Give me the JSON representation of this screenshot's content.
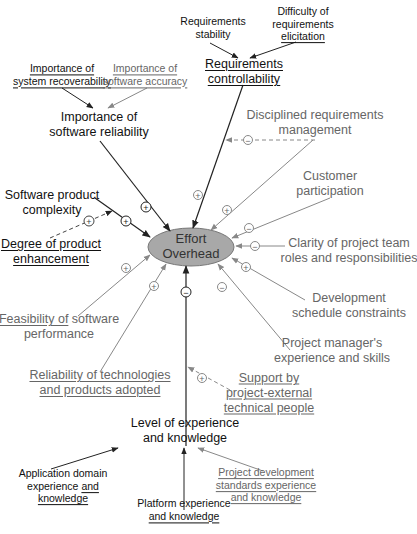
{
  "diagram": {
    "central_node": {
      "line1": "Effort",
      "line2": "Overhead",
      "fill": "#a8a8a8"
    },
    "colors": {
      "dark_edge": "#222222",
      "light_edge": "#888888",
      "text_dark": "#111111",
      "text_grey": "#666666"
    },
    "nodes": {
      "req_stability": {
        "line1": "Requirements",
        "line2": "stability"
      },
      "req_difficulty": {
        "line1": "Difficulty of",
        "line2": "requirements",
        "line3": "elicitation"
      },
      "req_control": {
        "line1": "Requirements",
        "line2": "controllability"
      },
      "imp_recover": {
        "line1": "Importance of",
        "line2": "system recoverability"
      },
      "imp_accuracy": {
        "line1": "Importance of",
        "line2": "software accuracy"
      },
      "imp_reliability": {
        "line1": "Importance of",
        "line2": "software reliability"
      },
      "disciplined": {
        "line1": "Disciplined requirements",
        "line2": "management"
      },
      "customer": {
        "line1": "Customer",
        "line2": "participation"
      },
      "sw_complexity": {
        "line1": "Software product",
        "line2": "complexity"
      },
      "degree_enh": {
        "line1": "Degree of product",
        "line2": "enhancement"
      },
      "clarity": {
        "line1": "Clarity of project team",
        "line2": "roles and responsibilities"
      },
      "dev_schedule": {
        "line1": "Development",
        "line2": "schedule constraints"
      },
      "feasibility": {
        "line1a": "Feasibility of",
        "line1b": " software",
        "line2": "performance"
      },
      "pm_experience": {
        "line1": "Project manager's",
        "line2": "experience and skills"
      },
      "reliability_tech": {
        "line1": "Reliability of technologies",
        "line2": "and products adopted"
      },
      "support": {
        "line1": "Support by",
        "line2": "project-external",
        "line3": "technical people"
      },
      "level_exp": {
        "line1": "Level of experience",
        "line2": "and knowledge"
      },
      "app_domain": {
        "line1": "Application domain",
        "line2a": "experience ",
        "line2b": "and",
        "line3": "knowledge"
      },
      "platform": {
        "line1": "Platform experience",
        "line2": "and knowledge"
      },
      "proj_dev_std": {
        "line1": "Project development",
        "line2": "standards experience",
        "line3": "and knowledge"
      }
    },
    "signs": {
      "plus": "+",
      "minus": "−"
    }
  }
}
